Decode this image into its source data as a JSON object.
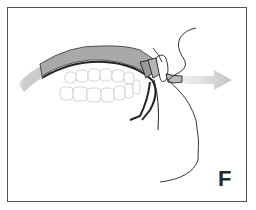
{
  "figure": {
    "panel_label": "F",
    "colors": {
      "frame": "#555555",
      "gingiva": "#a9a9a9",
      "arrow": "#c8c8c8",
      "outline": "#222222",
      "teeth_outline": "#d0d0d0"
    },
    "icons": [
      "direction-arrow",
      "teeth-arch",
      "lip-profile-line"
    ]
  }
}
